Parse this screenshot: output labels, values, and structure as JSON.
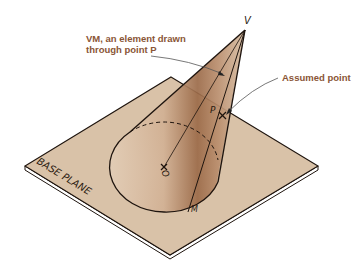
{
  "figure": {
    "colors": {
      "plane_fill": "#d9c2a8",
      "cone_fill": "#caa283",
      "cone_shadow": "#8a5a3b",
      "outline": "#1e140e",
      "callout_text": "#8a5536",
      "leader_line": "#555555"
    }
  },
  "labels": {
    "vertex": "V",
    "point_p": "P",
    "center": "O",
    "base_point": "M",
    "base_plane": "BASE PLANE"
  },
  "callouts": {
    "element_line1": "VM, an element drawn",
    "element_line2": "through point P",
    "assumed_point": "Assumed point"
  }
}
